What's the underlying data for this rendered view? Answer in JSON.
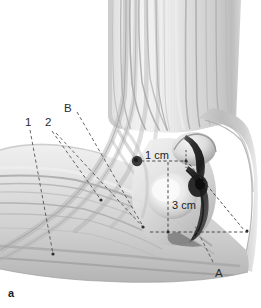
{
  "figure": {
    "panel_letter": "a",
    "background_color": "#ffffff",
    "ink_color": "#2b2b2b",
    "leader_line_color": "#4a4a4a",
    "bone_dark_color": "#2a2a2a",
    "skin_light_color": "#ececec",
    "skin_mid_color": "#d2d2d2",
    "skin_shadow_color": "#a8a8a8",
    "marker_dot_color": "#3a3a3a"
  },
  "labels": {
    "structure_1": "1",
    "structure_2": "2",
    "landmark_b": "B",
    "landmark_a": "A"
  },
  "measurements": {
    "distance_proximal": "1 cm",
    "distance_distal": "3 cm"
  },
  "label_positions": {
    "structure_1": {
      "x": 25,
      "y": 118
    },
    "structure_2": {
      "x": 45,
      "y": 118
    },
    "landmark_b": {
      "x": 64,
      "y": 104
    },
    "landmark_a": {
      "x": 216,
      "y": 270
    },
    "distance_proximal": {
      "x": 146,
      "y": 155
    },
    "distance_distal": {
      "x": 172,
      "y": 204
    }
  },
  "annotations": {
    "marker_dot": {
      "x": 137,
      "y": 161,
      "r": 5
    },
    "leader_count": 6,
    "measurement_line_style": "dashed"
  }
}
